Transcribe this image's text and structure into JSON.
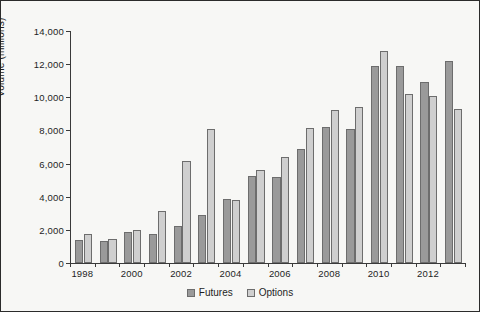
{
  "chart_data": {
    "type": "bar",
    "title": "",
    "xlabel": "",
    "ylabel": "Volume (millions)",
    "ylim": [
      0,
      14000
    ],
    "ytick_step": 2000,
    "ytick_labels": [
      "0",
      "2,000",
      "4,000",
      "6,000",
      "8,000",
      "10,000",
      "12,000",
      "14,000"
    ],
    "grid": false,
    "legend_position": "bottom-center",
    "categories": [
      "1998",
      "1999",
      "2000",
      "2001",
      "2002",
      "2003",
      "2004",
      "2005",
      "2006",
      "2007",
      "2008",
      "2009",
      "2010",
      "2011",
      "2012",
      "2013"
    ],
    "xtick_labels_shown": [
      "1998",
      "2000",
      "2002",
      "2004",
      "2006",
      "2008",
      "2010",
      "2012"
    ],
    "series": [
      {
        "name": "Futures",
        "color": "#9a9a9a",
        "values": [
          1400,
          1350,
          1900,
          1750,
          2250,
          2900,
          3850,
          5250,
          5200,
          6900,
          8200,
          8100,
          11900,
          11900,
          10900,
          12200
        ]
      },
      {
        "name": "Options",
        "color": "#cfcfcf",
        "values": [
          1750,
          1450,
          2000,
          3150,
          6150,
          8100,
          3800,
          5600,
          6400,
          8150,
          9250,
          9400,
          12800,
          10200,
          10050,
          9300
        ]
      }
    ]
  },
  "legend": {
    "items": [
      {
        "label": "Futures",
        "swatch": "futures-swatch"
      },
      {
        "label": "Options",
        "swatch": "options-swatch"
      }
    ]
  }
}
